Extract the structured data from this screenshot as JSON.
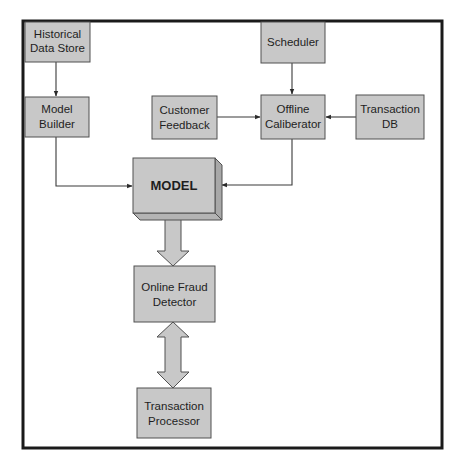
{
  "diagram": {
    "colors": {
      "box_fill": "#c8c8c8",
      "box_stroke": "#505050",
      "frame": "#1a1a1a",
      "connector": "#3a3a3a",
      "background": "#ffffff"
    },
    "nodes": {
      "historical_data_store": {
        "lines": [
          "Historical",
          "Data Store"
        ]
      },
      "model_builder": {
        "lines": [
          "Model",
          "Builder"
        ]
      },
      "customer_feedback": {
        "lines": [
          "Customer",
          "Feedback"
        ]
      },
      "scheduler": {
        "lines": [
          "Scheduler"
        ]
      },
      "offline_calibrator": {
        "lines": [
          "Offline",
          "Caliberator"
        ]
      },
      "transaction_db": {
        "lines": [
          "Transaction",
          "DB"
        ]
      },
      "model": {
        "lines": [
          "MODEL"
        ]
      },
      "online_fraud_detector": {
        "lines": [
          "Online Fraud",
          "Detector"
        ]
      },
      "transaction_processor": {
        "lines": [
          "Transaction",
          "Processor"
        ]
      }
    },
    "edges": [
      {
        "from": "Historical Data Store",
        "to": "Model Builder",
        "type": "arrow"
      },
      {
        "from": "Model Builder",
        "to": "MODEL",
        "type": "arrow"
      },
      {
        "from": "Scheduler",
        "to": "Offline Caliberator",
        "type": "arrow"
      },
      {
        "from": "Customer Feedback",
        "to": "Offline Caliberator",
        "type": "arrow"
      },
      {
        "from": "Transaction DB",
        "to": "Offline Caliberator",
        "type": "arrow"
      },
      {
        "from": "Offline Caliberator",
        "to": "MODEL",
        "type": "arrow"
      },
      {
        "from": "MODEL",
        "to": "Online Fraud Detector",
        "type": "block-arrow"
      },
      {
        "from": "Online Fraud Detector",
        "to": "Transaction Processor",
        "type": "double-block-arrow"
      }
    ]
  }
}
